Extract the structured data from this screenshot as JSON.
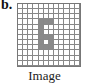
{
  "panel_label": "b.",
  "caption": "Image",
  "grid": {
    "rows": 12,
    "cols": 12,
    "filled_color": "#8a8a8a",
    "filled_cells": [
      [
        3,
        4
      ],
      [
        3,
        5
      ],
      [
        3,
        6
      ],
      [
        4,
        4
      ],
      [
        5,
        4
      ],
      [
        6,
        4
      ],
      [
        6,
        5
      ],
      [
        6,
        6
      ],
      [
        7,
        4
      ],
      [
        7,
        6
      ],
      [
        8,
        4
      ],
      [
        8,
        5
      ],
      [
        8,
        6
      ]
    ]
  }
}
